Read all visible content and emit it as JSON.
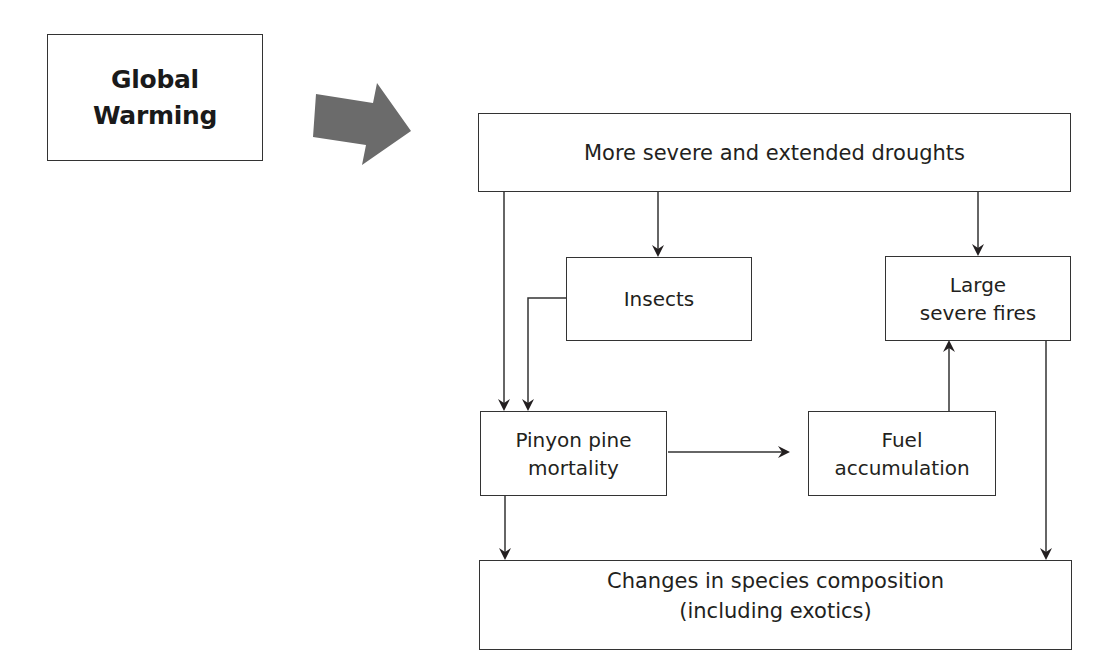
{
  "diagram": {
    "type": "flowchart",
    "colors": {
      "line": "#333333",
      "text": "#231f20",
      "block_arrow": "#6b6b6b",
      "background": "#ffffff"
    },
    "nodes": {
      "global_warming": {
        "line1": "Global",
        "line2": "Warming"
      },
      "droughts": {
        "line1": "More severe and extended droughts"
      },
      "insects": {
        "line1": "Insects"
      },
      "fires": {
        "line1": "Large",
        "line2": "severe fires"
      },
      "pinyon": {
        "line1": "Pinyon pine",
        "line2": "mortality"
      },
      "fuel": {
        "line1": "Fuel",
        "line2": "accumulation"
      },
      "species": {
        "line1": "Changes in species composition",
        "line2": "(including exotics)"
      }
    },
    "edges": [
      {
        "from": "global_warming",
        "to": "droughts",
        "style": "block-arrow"
      },
      {
        "from": "droughts",
        "to": "pinyon"
      },
      {
        "from": "droughts",
        "to": "insects"
      },
      {
        "from": "droughts",
        "to": "fires"
      },
      {
        "from": "insects",
        "to": "pinyon"
      },
      {
        "from": "pinyon",
        "to": "fuel"
      },
      {
        "from": "fuel",
        "to": "fires"
      },
      {
        "from": "pinyon",
        "to": "species"
      },
      {
        "from": "fires",
        "to": "species"
      }
    ]
  }
}
